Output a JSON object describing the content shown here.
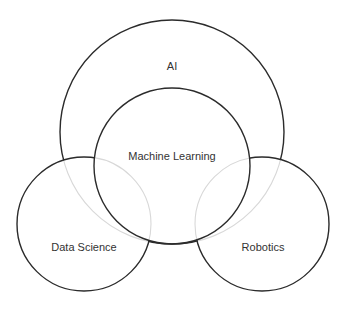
{
  "diagram": {
    "type": "venn",
    "sets": [
      {
        "id": "ai",
        "label": "AI"
      },
      {
        "id": "ml",
        "label": "Machine Learning"
      },
      {
        "id": "ds",
        "label": "Data Science"
      },
      {
        "id": "rob",
        "label": "Robotics"
      }
    ],
    "relationships": [
      {
        "inner": "ml",
        "outer": "ai",
        "relation": "subset"
      },
      {
        "a": "ds",
        "b": "ai",
        "relation": "overlap"
      },
      {
        "a": "ds",
        "b": "ml",
        "relation": "overlap"
      },
      {
        "a": "rob",
        "b": "ai",
        "relation": "overlap"
      },
      {
        "a": "rob",
        "b": "ml",
        "relation": "overlap"
      }
    ],
    "colors": {
      "stroke": "#2b2b2b",
      "hidden_stroke": "#d8d8d8",
      "text": "#333333",
      "background": "#ffffff"
    }
  }
}
